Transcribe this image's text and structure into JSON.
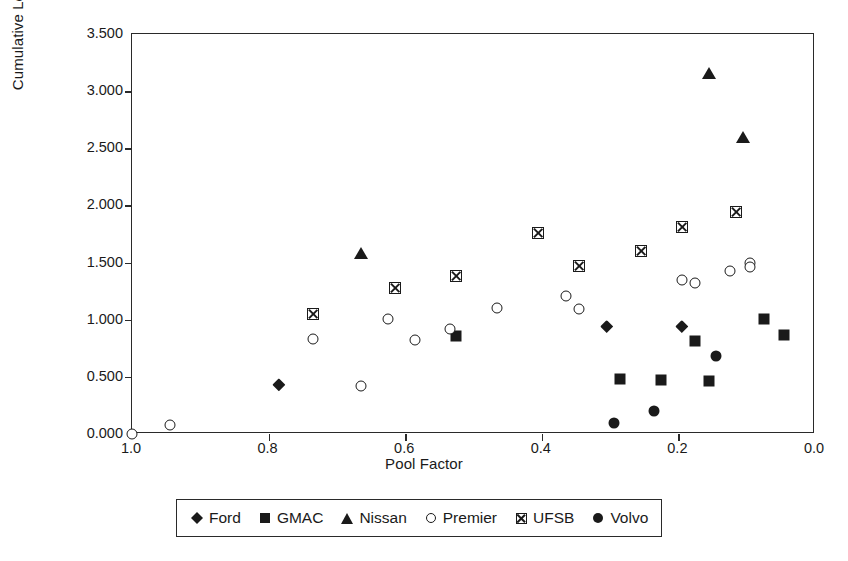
{
  "chart_data": {
    "type": "scatter",
    "title": "",
    "xlabel": "Pool Factor",
    "ylabel": "Cumulative Loss (%)",
    "xlim": [
      1.0,
      0.0
    ],
    "ylim": [
      0.0,
      3.5
    ],
    "x_reversed": true,
    "grid": false,
    "legend_position": "bottom",
    "xticks": [
      "1.0",
      "0.8",
      "0.6",
      "0.4",
      "0.2",
      "0.0"
    ],
    "xtick_values": [
      1.0,
      0.8,
      0.6,
      0.4,
      0.2,
      0.0
    ],
    "yticks": [
      "0.000",
      "0.500",
      "1.000",
      "1.500",
      "2.000",
      "2.500",
      "3.000",
      "3.500"
    ],
    "ytick_values": [
      0.0,
      0.5,
      1.0,
      1.5,
      2.0,
      2.5,
      3.0,
      3.5
    ],
    "series": [
      {
        "name": "Ford",
        "marker": "diamond",
        "color": "#1a1a1a",
        "points": [
          {
            "x": 0.785,
            "y": 0.43
          },
          {
            "x": 0.305,
            "y": 0.94
          },
          {
            "x": 0.195,
            "y": 0.94
          }
        ]
      },
      {
        "name": "GMAC",
        "marker": "square",
        "color": "#1a1a1a",
        "points": [
          {
            "x": 0.525,
            "y": 0.855
          },
          {
            "x": 0.285,
            "y": 0.48
          },
          {
            "x": 0.225,
            "y": 0.47
          },
          {
            "x": 0.175,
            "y": 0.81
          },
          {
            "x": 0.155,
            "y": 0.46
          },
          {
            "x": 0.075,
            "y": 1.01
          },
          {
            "x": 0.045,
            "y": 0.87
          }
        ]
      },
      {
        "name": "Nissan",
        "marker": "triangle",
        "color": "#1a1a1a",
        "points": [
          {
            "x": 0.665,
            "y": 1.58
          },
          {
            "x": 0.155,
            "y": 3.16
          },
          {
            "x": 0.105,
            "y": 2.6
          }
        ]
      },
      {
        "name": "Premier",
        "marker": "circle-open",
        "color": "#1a1a1a",
        "points": [
          {
            "x": 1.0,
            "y": 0.0
          },
          {
            "x": 0.945,
            "y": 0.08
          },
          {
            "x": 0.735,
            "y": 0.83
          },
          {
            "x": 0.665,
            "y": 0.42
          },
          {
            "x": 0.625,
            "y": 1.01
          },
          {
            "x": 0.585,
            "y": 0.82
          },
          {
            "x": 0.535,
            "y": 0.92
          },
          {
            "x": 0.465,
            "y": 1.1
          },
          {
            "x": 0.365,
            "y": 1.21
          },
          {
            "x": 0.345,
            "y": 1.09
          },
          {
            "x": 0.195,
            "y": 1.35
          },
          {
            "x": 0.175,
            "y": 1.32
          },
          {
            "x": 0.125,
            "y": 1.43
          },
          {
            "x": 0.095,
            "y": 1.5
          },
          {
            "x": 0.095,
            "y": 1.46
          }
        ]
      },
      {
        "name": "UFSB",
        "marker": "square-crossed",
        "color": "#1a1a1a",
        "points": [
          {
            "x": 0.735,
            "y": 1.05
          },
          {
            "x": 0.615,
            "y": 1.28
          },
          {
            "x": 0.525,
            "y": 1.38
          },
          {
            "x": 0.405,
            "y": 1.76
          },
          {
            "x": 0.345,
            "y": 1.47
          },
          {
            "x": 0.255,
            "y": 1.6
          },
          {
            "x": 0.195,
            "y": 1.81
          },
          {
            "x": 0.115,
            "y": 1.94
          }
        ]
      },
      {
        "name": "Volvo",
        "marker": "circle-filled",
        "color": "#1a1a1a",
        "points": [
          {
            "x": 0.295,
            "y": 0.1
          },
          {
            "x": 0.235,
            "y": 0.2
          },
          {
            "x": 0.145,
            "y": 0.68
          }
        ]
      }
    ]
  },
  "legend": {
    "items": [
      {
        "label": "Ford",
        "marker": "diamond"
      },
      {
        "label": "GMAC",
        "marker": "square"
      },
      {
        "label": "Nissan",
        "marker": "triangle"
      },
      {
        "label": "Premier",
        "marker": "circle-open"
      },
      {
        "label": "UFSB",
        "marker": "square-crossed"
      },
      {
        "label": "Volvo",
        "marker": "circle-filled"
      }
    ]
  }
}
